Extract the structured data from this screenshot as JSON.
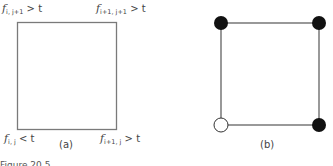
{
  "figure": {
    "panels": [
      {
        "id": "a",
        "label": "(a)",
        "square": {
          "x": 17,
          "y": 22,
          "w": 99,
          "h": 107,
          "stroke": "#7a7a7a"
        },
        "corners": [
          {
            "position": "top-left",
            "f": "f",
            "sub": "i, j+1",
            "rel": "> t"
          },
          {
            "position": "top-right",
            "f": "f",
            "sub": "i+1, j+1",
            "rel": "> t"
          },
          {
            "position": "bottom-left",
            "f": "f",
            "sub": "i, j",
            "rel": "< t"
          },
          {
            "position": "bottom-right",
            "f": "f",
            "sub": "i+1, j",
            "rel": "> t"
          }
        ]
      },
      {
        "id": "b",
        "label": "(b)",
        "square": {
          "x": 221,
          "y": 23,
          "w": 98,
          "h": 102,
          "stroke": "#555555"
        },
        "vertices": [
          {
            "position": "top-left",
            "state": "filled",
            "color": "#111111"
          },
          {
            "position": "top-right",
            "state": "filled",
            "color": "#111111"
          },
          {
            "position": "bottom-left",
            "state": "open",
            "color": "#ffffff"
          },
          {
            "position": "bottom-right",
            "state": "filled",
            "color": "#111111"
          }
        ]
      }
    ],
    "caption": "Figure 20.5 ..."
  }
}
